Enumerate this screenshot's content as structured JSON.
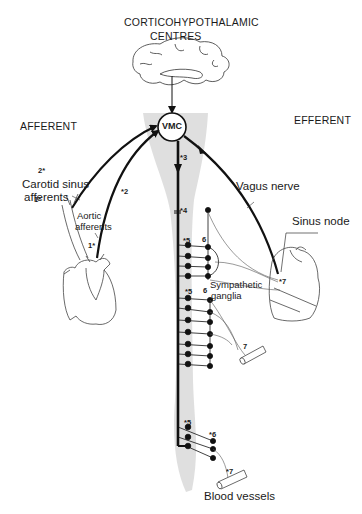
{
  "diagram": {
    "title_line1": "CORTICOHYPOTHALAMIC",
    "title_line2": "CENTRES",
    "left_heading": "AFFERENT",
    "right_heading": "EFFERENT",
    "center_node": "VMC",
    "labels": {
      "carotid_line1": "Carotid sinus",
      "carotid_line2": "afferents",
      "aortic_line1": "Aortic",
      "aortic_line2": "afferents",
      "vagus": "Vagus nerve",
      "sinus_node": "Sinus node",
      "sympathetic_line1": "Sympathetic",
      "sympathetic_line2": "ganglia",
      "blood_vessels": "Blood vessels"
    },
    "markers": {
      "m1a": "1*",
      "m1b": "1*",
      "m2a": "2*",
      "m2b": "*2",
      "m3": "*3",
      "m4": "*4",
      "m5a": "*5",
      "m6a": "6",
      "m7a": "*7",
      "m5b": "*5",
      "m6b": "6",
      "m7b": "7",
      "m5c": "*5",
      "m6c": "*6",
      "m7c": "*7"
    },
    "colors": {
      "line": "#111111",
      "shading": "#d9d9d9",
      "thin": "#444444"
    }
  }
}
